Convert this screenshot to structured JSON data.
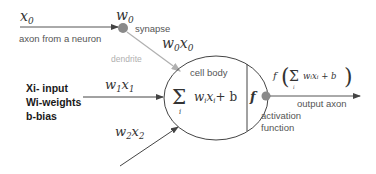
{
  "diagram": {
    "input_axon": {
      "variable": "x",
      "subscript": "0",
      "label": "axon from a neuron"
    },
    "synapse": {
      "weight": "w",
      "weight_subscript": "0",
      "label": "synapse",
      "product": "w",
      "product_sub1": "0",
      "product_var": "x",
      "product_sub2": "0"
    },
    "dendrite": {
      "label": "dendrite"
    },
    "input1": {
      "w": "w",
      "w_sub": "1",
      "x": "x",
      "x_sub": "1"
    },
    "input2": {
      "w": "w",
      "w_sub": "2",
      "x": "x",
      "x_sub": "2"
    },
    "legend": [
      {
        "text": "Xi- input"
      },
      {
        "text": "Wi-weights"
      },
      {
        "text": "b-bias"
      }
    ],
    "cell_body": {
      "label": "cell body",
      "sigma": "Σ",
      "sigma_index": "i",
      "sum_expr_w": "w",
      "sum_expr_wsub": "i",
      "sum_expr_x": "x",
      "sum_expr_xsub": "i",
      "sum_expr_tail": "+ b",
      "activation_symbol": "f"
    },
    "output": {
      "formula_f": "f",
      "formula_sigma": "Σ",
      "formula_index": "i",
      "formula_body": "wᵢxᵢ + b",
      "label": "output axon"
    },
    "activation": {
      "line1": "activation",
      "line2": "function"
    },
    "colors": {
      "line": "#444444",
      "dendrite": "#b0b0b0",
      "dot": "#8a8a8a",
      "text_label": "#555555",
      "text_bold": "#1a1a1a"
    }
  }
}
